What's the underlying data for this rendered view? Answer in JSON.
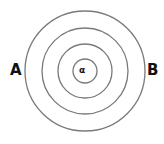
{
  "diagram": {
    "type": "concentric-circles",
    "center": {
      "x": 85,
      "y": 71
    },
    "radii": [
      60,
      43,
      27,
      12
    ],
    "stroke_color": "#7a7a7a",
    "labels": {
      "left": "A",
      "right": "B",
      "center": "α"
    }
  }
}
